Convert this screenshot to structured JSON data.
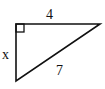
{
  "diagram": {
    "type": "right-triangle",
    "labels": {
      "top_side": "4",
      "left_side": "x",
      "hypotenuse": "7"
    },
    "right_angle_marker": true,
    "colors": {
      "stroke": "#111111",
      "background": "#ffffff"
    }
  }
}
